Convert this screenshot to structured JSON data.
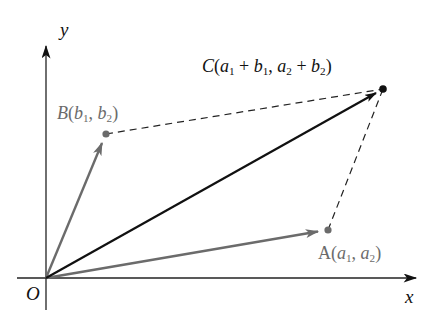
{
  "diagram": {
    "type": "vector-addition-parallelogram",
    "axes": {
      "x_label": "x",
      "y_label": "y",
      "origin_label": "O"
    },
    "points": {
      "A": {
        "name": "A",
        "coords": "(a1, a2)",
        "color": "#6b6b6b"
      },
      "B": {
        "name": "B",
        "coords": "(b1, b2)",
        "color": "#6b6b6b"
      },
      "C": {
        "name": "C",
        "coords": "(a1 + b1, a2 + b2)",
        "color": "#111111"
      }
    },
    "vectors": [
      {
        "from": "O",
        "to": "A",
        "color": "#6b6b6b",
        "style": "solid-arrow"
      },
      {
        "from": "O",
        "to": "B",
        "color": "#6b6b6b",
        "style": "solid-arrow"
      },
      {
        "from": "O",
        "to": "C",
        "color": "#111111",
        "style": "solid-arrow"
      }
    ],
    "edges": [
      {
        "from": "B",
        "to": "C",
        "style": "dashed"
      },
      {
        "from": "A",
        "to": "C",
        "style": "dashed"
      }
    ],
    "label_parts": {
      "B": {
        "letter": "B",
        "open": "(",
        "v1": "b",
        "s1": "1",
        "sep": ", ",
        "v2": "b",
        "s2": "2",
        "close": ")"
      },
      "A": {
        "letter": "A",
        "open": "(",
        "v1": "a",
        "s1": "1",
        "sep": ", ",
        "v2": "a",
        "s2": "2",
        "close": ")"
      },
      "C": {
        "letter": "C",
        "open": "(",
        "p1": "a",
        "p1s": "1",
        "plus1": " + ",
        "p2": "b",
        "p2s": "1",
        "sep": ", ",
        "p3": "a",
        "p3s": "2",
        "plus2": " + ",
        "p4": "b",
        "p4s": "2",
        "close": ")"
      }
    }
  }
}
